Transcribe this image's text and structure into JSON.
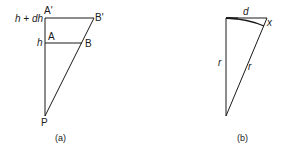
{
  "figure_a": {
    "caption": "(a)",
    "labels": {
      "h_plus_dh": "h + dh",
      "h": "h",
      "A_prime": "A'",
      "B_prime": "B'",
      "A": "A",
      "B": "B",
      "P": "P"
    }
  },
  "figure_b": {
    "caption": "(b)",
    "labels": {
      "d": "d",
      "x": "x",
      "r_left": "r",
      "r_right": "r"
    }
  },
  "colors": {
    "line": "#1a1a1a",
    "background": "#ffffff"
  }
}
